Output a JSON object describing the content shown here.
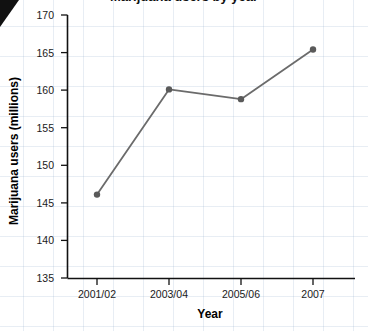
{
  "page": {
    "corner_marker": "black-triangle",
    "title_partial": "Marijuana users by year"
  },
  "chart_data": {
    "type": "line",
    "title": "Marijuana users by year",
    "xlabel": "Year",
    "ylabel": "Marijuana users (millions)",
    "categories": [
      "2001/02",
      "2003/04",
      "2005/06",
      "2007"
    ],
    "values": [
      146.1,
      160.1,
      158.8,
      165.4
    ],
    "series": [
      {
        "name": "Marijuana users (millions)",
        "values": [
          146.1,
          160.1,
          158.8,
          165.4
        ]
      }
    ],
    "ylim": [
      135,
      170
    ],
    "yticks": [
      135,
      140,
      145,
      150,
      155,
      160,
      165,
      170
    ],
    "ytick_labels": [
      "135",
      "140",
      "145",
      "150",
      "155",
      "160",
      "165",
      "170"
    ],
    "xtick_labels": [
      "2001/02",
      "2003/04",
      "2005/06",
      "2007"
    ],
    "grid": false,
    "legend": "none",
    "line_color": "#6b6b6b",
    "marker_color": "#5a5a5a",
    "axis_color": "#111111",
    "background_grid_color": "#c3d2e6"
  }
}
